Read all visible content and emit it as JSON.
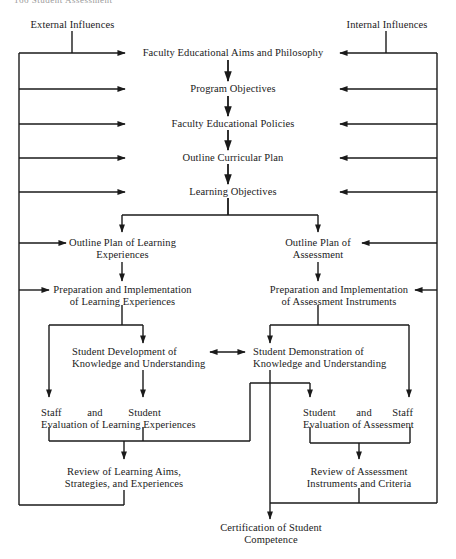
{
  "header": {
    "cut_text": "166  Student Assessment"
  },
  "sources": {
    "external": "External Influences",
    "internal": "Internal Influences"
  },
  "chain": [
    {
      "id": "aims",
      "label": "Faculty Educational Aims and Philosophy"
    },
    {
      "id": "program_objectives",
      "label": "Program Objectives"
    },
    {
      "id": "policies",
      "label": "Faculty Educational Policies"
    },
    {
      "id": "curricular_plan",
      "label": "Outline Curricular Plan"
    },
    {
      "id": "learning_objectives",
      "label": "Learning Objectives"
    }
  ],
  "learning_branch": {
    "outline_plan": [
      "Outline Plan of Learning",
      "Experiences"
    ],
    "preparation": [
      "Preparation and Implementation",
      "of Learning Experiences"
    ],
    "development": [
      "Student Development of",
      "Knowledge and Understanding"
    ],
    "evaluation": {
      "words": [
        "Staff",
        "and",
        "Student"
      ],
      "line2": "Evaluation of Learning Experiences"
    },
    "review": [
      "Review of Learning Aims,",
      "Strategies, and Experiences"
    ]
  },
  "assessment_branch": {
    "outline_plan": [
      "Outline Plan of",
      "Assessment"
    ],
    "preparation": [
      "Preparation and Implementation",
      "of Assessment Instruments"
    ],
    "demonstration": [
      "Student Demonstration of",
      "Knowledge and Understanding"
    ],
    "evaluation": {
      "words": [
        "Student",
        "and",
        "Staff"
      ],
      "line2": "Evaluation of Assessment"
    },
    "review": [
      "Review of Assessment",
      "Instruments and Criteria"
    ]
  },
  "outcome": [
    "Certification of Student",
    "Competence"
  ],
  "colors": {
    "line": "#1a1a1a",
    "text": "#1a1a1a",
    "background": "#ffffff"
  }
}
